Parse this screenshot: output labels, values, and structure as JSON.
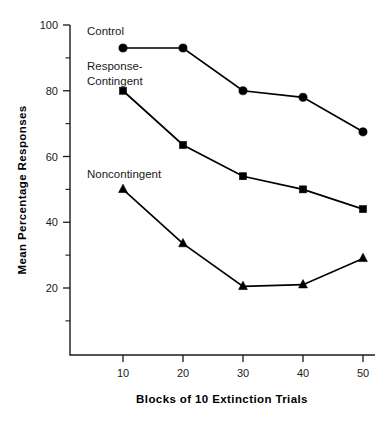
{
  "chart_data": {
    "type": "line",
    "title": "",
    "xlabel": "Blocks of 10 Extinction Trials",
    "ylabel": "Mean Percentage Responses",
    "x": [
      10,
      20,
      30,
      40,
      50
    ],
    "categories": [
      "10",
      "20",
      "30",
      "40",
      "50"
    ],
    "xlim": [
      0,
      55
    ],
    "ylim": [
      0,
      100
    ],
    "grid": false,
    "legend_position": "inline-annotations",
    "x_tick_labels": [
      "10",
      "20",
      "30",
      "40",
      "50"
    ],
    "y_tick_labels": [
      "20",
      "40",
      "60",
      "80",
      "100"
    ],
    "y_major_ticks": [
      20,
      40,
      60,
      80,
      100
    ],
    "y_minor_ticks": [
      10,
      30,
      50,
      70,
      90
    ],
    "series": [
      {
        "name": "Control",
        "marker": "circle",
        "values": [
          93,
          93,
          80,
          78,
          67.5
        ]
      },
      {
        "name": "Response-Contingent",
        "marker": "square",
        "values": [
          80,
          63.5,
          54,
          50,
          44
        ]
      },
      {
        "name": "Noncontingent",
        "marker": "triangle",
        "values": [
          50,
          33.5,
          20.5,
          21,
          29
        ]
      }
    ],
    "annotations": [
      {
        "text": "Control",
        "x": 10,
        "y": 98
      },
      {
        "text": "Response-",
        "x": 10,
        "y": 88
      },
      {
        "text": "Contingent",
        "x": 10,
        "y": 83
      },
      {
        "text": "Noncontingent",
        "x": 10,
        "y": 57
      }
    ],
    "colors": {
      "line": "#000000",
      "marker": "#000000",
      "axis": "#1a1a1a",
      "background": "#ffffff"
    }
  },
  "labels": {
    "annotation_control": "Control",
    "annotation_response": "Response-",
    "annotation_contingent": "Contingent",
    "annotation_noncontingent": "Noncontingent",
    "y_axis_title": "Mean Percentage Responses",
    "x_axis_title": "Blocks of 10 Extinction Trials",
    "y_tick_100": "100",
    "y_tick_80": "80",
    "y_tick_60": "60",
    "y_tick_40": "40",
    "y_tick_20": "20",
    "x_tick_10": "10",
    "x_tick_20": "20",
    "x_tick_30": "30",
    "x_tick_40": "40",
    "x_tick_50": "50"
  }
}
